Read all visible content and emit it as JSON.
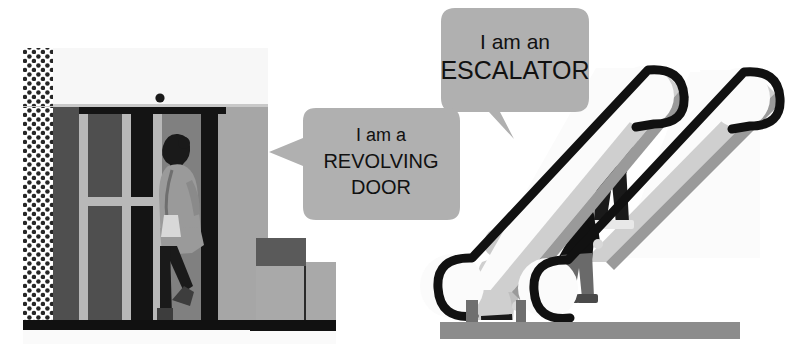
{
  "illustration": {
    "title": "Revolving door and escalator vocabulary illustration",
    "background_color": "#ffffff",
    "width": 790,
    "height": 356
  },
  "callouts": [
    {
      "id": "revolving-door-callout",
      "lines": [
        "I am a",
        "REVOLVING",
        "DOOR"
      ],
      "line1": "I am a",
      "line2": "REVOLVING",
      "line3": "DOOR",
      "bubble_color": "#b0b0b0",
      "text_color": "#111111",
      "tail_direction": "left",
      "points_at": "revolving-door"
    },
    {
      "id": "escalator-callout",
      "lines": [
        "I am an",
        "ESCALATOR"
      ],
      "line1": "I am an",
      "line2": "ESCALATOR",
      "bubble_color": "#b0b0b0",
      "text_color": "#111111",
      "tail_direction": "down-right",
      "points_at": "escalator"
    }
  ],
  "scene_objects": {
    "building": {
      "label": "building-facade",
      "wall_color": "#f2f2f2",
      "dotted_wall_color": "#262626",
      "canopy_color": "#f7f7f7",
      "light_fixture": "ceiling-dot",
      "door_frame_color": "#b8b8b8",
      "door_glass_color": "#4f4f4f",
      "door_dark_panel_color": "#141414",
      "side_panel_color": "#a6a6a6",
      "ground_color": "#111111"
    },
    "revolving_door": {
      "label": "revolving-door",
      "wings": 4,
      "person": {
        "label": "person-entering-door",
        "coat_color": "#9a9a9a",
        "trousers_color": "#1a1a1a",
        "hair_color": "#1a1a1a",
        "bag": "shoulder-bag",
        "bag_color": "#d8d8d8",
        "shoe_color": "#3d3d3d"
      }
    },
    "steps_block": {
      "label": "exterior-steps",
      "top_color": "#5a5a5a",
      "mid_color": "#a9a9a9",
      "base_color": "#111111"
    },
    "escalator": {
      "label": "escalator",
      "balustrade_color": "#fbfbfb",
      "balustrade_edge_color": "#9a9a9a",
      "balustrade_shadow_color": "#cfcfcf",
      "handrail_color": "#111111",
      "step_tread_color": "#d5d5d5",
      "step_riser_color": "#9f9f9f",
      "step_side_color": "#bfbfbf",
      "floor_color": "#8c8c8c",
      "direction": "up",
      "riders": [
        {
          "label": "rider-bottom",
          "position": "bottom",
          "coat_color": "#cfcfcf",
          "trousers_color": "#1a1a1a",
          "hair_color": "#c9c9c9",
          "shoe_color": "#4a4a4a"
        },
        {
          "label": "rider-middle",
          "position": "middle",
          "coat_color": "#111111",
          "trousers_color": "#6a6a6a",
          "hair_color": "#bdbdbd",
          "shoe_color": "#4a4a4a"
        },
        {
          "label": "rider-top",
          "position": "top",
          "coat_color": "#8e8e8e",
          "trousers_color": "#1a1a1a",
          "hair_color": "#1a1a1a",
          "hairstyle": "ponytail",
          "shoe_color": "#e8e8e8"
        }
      ]
    }
  }
}
